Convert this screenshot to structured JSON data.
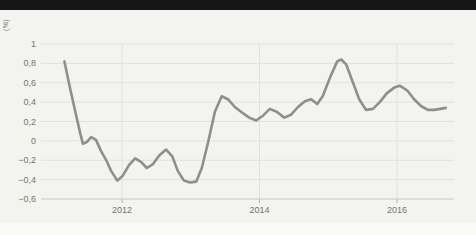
{
  "header": {
    "bar_color": "#151515"
  },
  "chart": {
    "unit_label": "(%)",
    "bg_color": "#f3f3f0",
    "grid_color": "#e1e1dd",
    "axis_color": "#c8c8c4",
    "tick_color": "#b3b3af",
    "label_color": "#75756f",
    "line_color": "#8e8e8c"
  },
  "chart_data": {
    "type": "line",
    "title": "",
    "xlabel": "",
    "ylabel": "(%)",
    "grid": true,
    "legend": "none",
    "xlim": [
      2010.82,
      2016.83
    ],
    "ylim": [
      -0.6,
      1
    ],
    "yticks": [
      {
        "value": 1,
        "label": "1"
      },
      {
        "value": 0.8,
        "label": "0,8"
      },
      {
        "value": 0.6,
        "label": "0,6"
      },
      {
        "value": 0.4,
        "label": "0,4"
      },
      {
        "value": 0.2,
        "label": "0,2"
      },
      {
        "value": 0,
        "label": "0"
      },
      {
        "value": -0.2,
        "label": "−0,2"
      },
      {
        "value": -0.4,
        "label": "−0,4"
      },
      {
        "value": -0.6,
        "label": "−0,6"
      }
    ],
    "xticks": [
      {
        "value": 2012,
        "label": "2012"
      },
      {
        "value": 2014,
        "label": "2014"
      },
      {
        "value": 2016,
        "label": "2016"
      }
    ],
    "x": [
      2011.16,
      2011.24,
      2011.33,
      2011.39,
      2011.43,
      2011.49,
      2011.55,
      2011.62,
      2011.69,
      2011.77,
      2011.84,
      2011.93,
      2012.01,
      2012.1,
      2012.19,
      2012.28,
      2012.36,
      2012.45,
      2012.54,
      2012.64,
      2012.73,
      2012.81,
      2012.9,
      2012.99,
      2013.08,
      2013.16,
      2013.25,
      2013.35,
      2013.45,
      2013.54,
      2013.64,
      2013.75,
      2013.85,
      2013.95,
      2014.05,
      2014.15,
      2014.25,
      2014.36,
      2014.46,
      2014.56,
      2014.66,
      2014.75,
      2014.84,
      2014.92,
      2015.03,
      2015.13,
      2015.19,
      2015.26,
      2015.35,
      2015.45,
      2015.55,
      2015.65,
      2015.75,
      2015.85,
      2015.96,
      2016.04,
      2016.15,
      2016.25,
      2016.35,
      2016.45,
      2016.54,
      2016.63,
      2016.71
    ],
    "y": [
      0.82,
      0.55,
      0.27,
      0.08,
      -0.03,
      -0.01,
      0.04,
      0.01,
      -0.1,
      -0.2,
      -0.31,
      -0.41,
      -0.36,
      -0.25,
      -0.18,
      -0.22,
      -0.28,
      -0.24,
      -0.15,
      -0.09,
      -0.16,
      -0.31,
      -0.41,
      -0.43,
      -0.42,
      -0.28,
      -0.02,
      0.3,
      0.46,
      0.43,
      0.35,
      0.29,
      0.24,
      0.21,
      0.26,
      0.33,
      0.3,
      0.24,
      0.27,
      0.35,
      0.41,
      0.43,
      0.38,
      0.46,
      0.66,
      0.82,
      0.84,
      0.79,
      0.62,
      0.43,
      0.32,
      0.33,
      0.4,
      0.49,
      0.55,
      0.57,
      0.52,
      0.43,
      0.36,
      0.32,
      0.32,
      0.33,
      0.34
    ]
  }
}
